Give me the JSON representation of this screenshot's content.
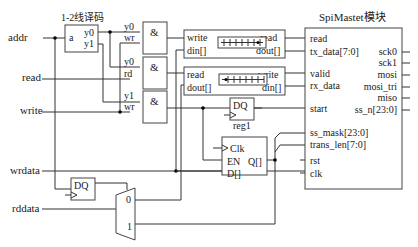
{
  "diagram": {
    "inputs": {
      "addr": "addr",
      "read": "read",
      "write": "write",
      "wrdata": "wrdata",
      "rddata": "rddata"
    },
    "decoder": {
      "title": "1-2线译码",
      "input": "a",
      "out0": "y0",
      "out1": "y1"
    },
    "and_gates": [
      {
        "symbol": "&",
        "in_a": "y0",
        "in_b": "wr"
      },
      {
        "symbol": "&",
        "in_a": "y0",
        "in_b": "rd"
      },
      {
        "symbol": "&",
        "in_a": "y1",
        "in_b": "wr"
      }
    ],
    "fifo_tx": {
      "left_ports": [
        "write",
        "din[]"
      ],
      "right_ports": [
        "read",
        "dout[]"
      ]
    },
    "fifo_rx": {
      "left_ports": [
        "read",
        "dout[]"
      ],
      "right_ports": [
        "write",
        "din[]"
      ]
    },
    "reg1": {
      "label": "DQ",
      "name": "reg1"
    },
    "reg2": {
      "clk": "Clk",
      "en": "EN",
      "q": "Q[]",
      "d": "D[]"
    },
    "dff_bottom": {
      "label": "DQ"
    },
    "mux": {
      "in0": "0",
      "in1": "1"
    },
    "spi": {
      "title": "SpiMastet模块",
      "left_ports": [
        "read",
        "tx_data[7:0]",
        "valid",
        "rx_data",
        "start",
        "ss_mask[23:0]",
        "trans_len[7:0]",
        "rst",
        "clk"
      ],
      "right_ports": [
        "sck0",
        "sck1",
        "mosi",
        "mosi_tri",
        "miso",
        "ss_n[23:0]"
      ]
    }
  }
}
